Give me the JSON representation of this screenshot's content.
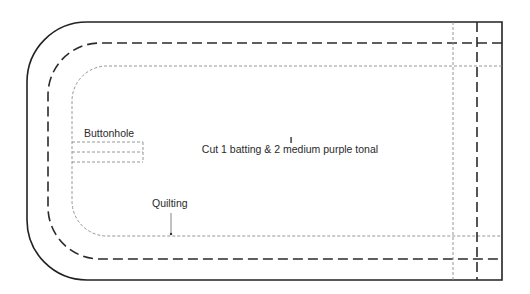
{
  "diagram": {
    "type": "sewing-pattern-piece",
    "labels": {
      "buttonhole": "Buttonhole",
      "quilting": "Quilting",
      "cut_instruction": "Cut 1 batting & 2 medium purple tonal",
      "grainline_mark": "I"
    },
    "line_styles": {
      "cut_line": "solid",
      "seam_line": "long-dashed",
      "quilting_line": "short-dotted"
    },
    "colors": {
      "background": "#ffffff",
      "cut_line": "#222222",
      "seam_line": "#2b2b2b",
      "quilting_line": "#8a8a8a",
      "text": "#2a2a2a"
    }
  }
}
